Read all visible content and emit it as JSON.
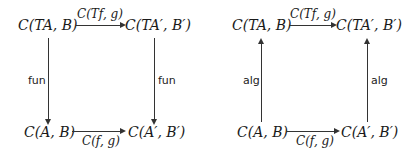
{
  "diagrams": [
    {
      "name": "fun-square",
      "nodes": {
        "top_left": "C(TA, B)",
        "top_right": "C(TA′, B′)",
        "bottom_left": "C(A, B)",
        "bottom_right": "C(A′, B′)"
      },
      "edges": {
        "top": "C(Tf, g)",
        "bottom": "C(f, g)",
        "left": "fun",
        "right": "fun"
      },
      "vertical_direction": "down"
    },
    {
      "name": "alg-square",
      "nodes": {
        "top_left": "C(TA, B)",
        "top_right": "C(TA′, B′)",
        "bottom_left": "C(A, B)",
        "bottom_right": "C(A′, B′)"
      },
      "edges": {
        "top": "C(Tf, g)",
        "bottom": "C(f, g)",
        "left": "alg",
        "right": "alg"
      },
      "vertical_direction": "up"
    }
  ]
}
